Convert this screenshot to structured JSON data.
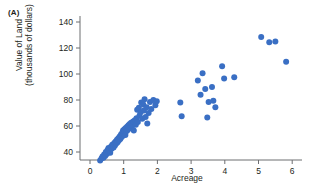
{
  "panel": {
    "label": "(A)"
  },
  "axis_labels": {
    "x": "Acreage",
    "y_line1": "Value of Land",
    "y_line2": "(thousands of dollars)"
  },
  "style": {
    "marker_color": "#3a6fc4",
    "axis_color": "#6d6e71",
    "text_color": "#231f20"
  },
  "chart_data": {
    "type": "scatter",
    "title": "",
    "xlabel": "Acreage",
    "ylabel": "Value of Land (thousands of dollars)",
    "xlim": [
      0,
      6.4
    ],
    "ylim": [
      30,
      145
    ],
    "xticks": [
      0,
      1,
      2,
      3,
      4,
      5,
      6
    ],
    "yticks": [
      40,
      60,
      80,
      100,
      120,
      140
    ],
    "xtick_labels": [
      "0",
      "1",
      "2",
      "3",
      "4",
      "5",
      "6"
    ],
    "ytick_labels": [
      "40",
      "60",
      "80",
      "100",
      "120",
      "140"
    ],
    "grid": false,
    "legend": false,
    "marker_size": 3,
    "series": [
      {
        "name": "Land parcels",
        "color": "#3a6fc4",
        "points": [
          [
            0.3,
            33.5
          ],
          [
            0.34,
            35.0
          ],
          [
            0.37,
            36.5
          ],
          [
            0.4,
            35.5
          ],
          [
            0.42,
            38.0
          ],
          [
            0.45,
            37.0
          ],
          [
            0.47,
            40.0
          ],
          [
            0.5,
            38.5
          ],
          [
            0.52,
            41.5
          ],
          [
            0.55,
            40.5
          ],
          [
            0.55,
            43.0
          ],
          [
            0.58,
            42.0
          ],
          [
            0.6,
            39.5
          ],
          [
            0.62,
            44.0
          ],
          [
            0.64,
            42.5
          ],
          [
            0.66,
            45.5
          ],
          [
            0.68,
            44.5
          ],
          [
            0.7,
            43.5
          ],
          [
            0.72,
            47.0
          ],
          [
            0.74,
            45.0
          ],
          [
            0.76,
            48.0
          ],
          [
            0.78,
            46.5
          ],
          [
            0.8,
            49.5
          ],
          [
            0.82,
            47.5
          ],
          [
            0.84,
            50.5
          ],
          [
            0.86,
            49.0
          ],
          [
            0.88,
            52.0
          ],
          [
            0.9,
            50.0
          ],
          [
            0.92,
            53.5
          ],
          [
            0.94,
            51.5
          ],
          [
            0.96,
            55.0
          ],
          [
            0.97,
            52.5
          ],
          [
            0.98,
            56.5
          ],
          [
            1.0,
            54.0
          ],
          [
            1.02,
            57.5
          ],
          [
            1.03,
            55.5
          ],
          [
            1.05,
            53.0
          ],
          [
            1.06,
            58.5
          ],
          [
            1.08,
            56.0
          ],
          [
            1.1,
            59.5
          ],
          [
            1.12,
            57.0
          ],
          [
            1.14,
            60.5
          ],
          [
            1.16,
            58.0
          ],
          [
            1.18,
            61.5
          ],
          [
            1.2,
            59.0
          ],
          [
            1.22,
            62.5
          ],
          [
            1.25,
            60.0
          ],
          [
            1.28,
            63.5
          ],
          [
            1.3,
            56.5
          ],
          [
            1.33,
            64.5
          ],
          [
            1.36,
            61.0
          ],
          [
            1.38,
            66.0
          ],
          [
            1.4,
            72.5
          ],
          [
            1.42,
            63.0
          ],
          [
            1.45,
            74.0
          ],
          [
            1.47,
            68.0
          ],
          [
            1.5,
            70.5
          ],
          [
            1.52,
            78.0
          ],
          [
            1.55,
            65.5
          ],
          [
            1.58,
            76.5
          ],
          [
            1.6,
            72.0
          ],
          [
            1.62,
            80.5
          ],
          [
            1.65,
            67.0
          ],
          [
            1.68,
            74.5
          ],
          [
            1.7,
            62.0
          ],
          [
            1.74,
            70.0
          ],
          [
            1.78,
            78.5
          ],
          [
            1.82,
            73.0
          ],
          [
            1.88,
            80.0
          ],
          [
            1.94,
            76.0
          ],
          [
            1.98,
            79.0
          ],
          [
            2.68,
            78.0
          ],
          [
            2.72,
            67.5
          ],
          [
            3.2,
            95.0
          ],
          [
            3.28,
            84.0
          ],
          [
            3.34,
            100.5
          ],
          [
            3.42,
            88.5
          ],
          [
            3.48,
            66.5
          ],
          [
            3.52,
            78.5
          ],
          [
            3.62,
            90.0
          ],
          [
            3.66,
            79.5
          ],
          [
            3.72,
            74.5
          ],
          [
            3.92,
            106.0
          ],
          [
            3.98,
            96.5
          ],
          [
            4.28,
            97.5
          ],
          [
            5.08,
            128.5
          ],
          [
            5.32,
            124.5
          ],
          [
            5.5,
            125.0
          ],
          [
            5.82,
            109.5
          ]
        ]
      }
    ]
  }
}
